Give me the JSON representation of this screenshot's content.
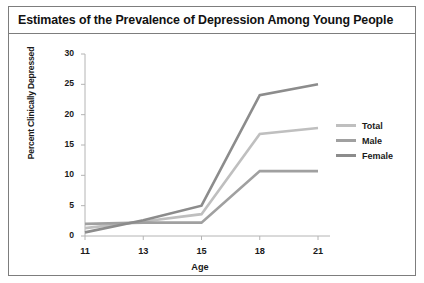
{
  "figure": {
    "title": "Estimates of the Prevalence of Depression Among Young People"
  },
  "chart_data": {
    "type": "line",
    "title": "Estimates of the Prevalence of Depression Among Young People",
    "xlabel": "Age",
    "ylabel": "Percent Clinically Depressed",
    "x": [
      11,
      13,
      15,
      18,
      21
    ],
    "xtick_labels": [
      "11",
      "13",
      "15",
      "18",
      "21"
    ],
    "ytick_labels": [
      "0",
      "5",
      "10",
      "15",
      "20",
      "25",
      "30"
    ],
    "yticks": [
      0,
      5,
      10,
      15,
      20,
      25,
      30
    ],
    "ylim": [
      0,
      30
    ],
    "xlim": [
      11,
      21
    ],
    "grid": false,
    "legend_position": "right",
    "series": [
      {
        "name": "Total",
        "color": "#bfbfbf",
        "values": [
          1.3,
          2.4,
          3.6,
          16.8,
          17.8
        ]
      },
      {
        "name": "Male",
        "color": "#a0a0a0",
        "values": [
          2.0,
          2.2,
          2.2,
          10.7,
          10.7
        ]
      },
      {
        "name": "Female",
        "color": "#8c8c8c",
        "values": [
          0.6,
          2.6,
          5.0,
          23.2,
          25.0
        ]
      }
    ]
  },
  "legend": {
    "items": [
      {
        "label": "Total",
        "color": "#bfbfbf"
      },
      {
        "label": "Male",
        "color": "#a0a0a0"
      },
      {
        "label": "Female",
        "color": "#8c8c8c"
      }
    ]
  },
  "colors": {
    "frame": "#7d7d7d",
    "axis": "#b4b4b4",
    "text": "#1a1a1a",
    "background": "#ffffff"
  }
}
